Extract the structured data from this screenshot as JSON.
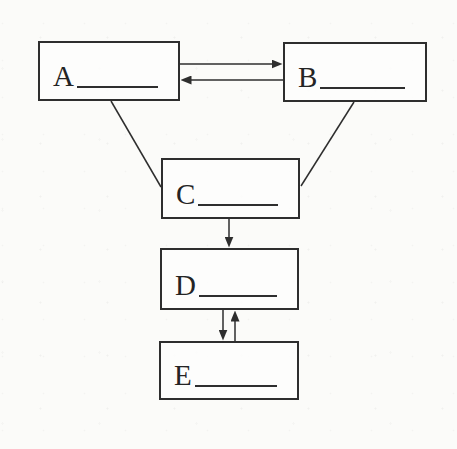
{
  "page": {
    "background_color": "#fbfbf9",
    "ink_color": "#2e2e2e"
  },
  "diagram": {
    "type": "flowchart",
    "nodes": [
      {
        "id": "A",
        "label": "A",
        "blank": true
      },
      {
        "id": "B",
        "label": "B",
        "blank": true
      },
      {
        "id": "C",
        "label": "C",
        "blank": true
      },
      {
        "id": "D",
        "label": "D",
        "blank": true
      },
      {
        "id": "E",
        "label": "E",
        "blank": true
      }
    ],
    "edges": [
      {
        "from": "A",
        "to": "B",
        "style": "arrow",
        "orientation": "horizontal"
      },
      {
        "from": "B",
        "to": "A",
        "style": "arrow",
        "orientation": "horizontal"
      },
      {
        "from": "A",
        "to": "C",
        "style": "plain-line",
        "orientation": "diagonal"
      },
      {
        "from": "B",
        "to": "C",
        "style": "plain-line",
        "orientation": "diagonal"
      },
      {
        "from": "C",
        "to": "D",
        "style": "arrow",
        "orientation": "vertical"
      },
      {
        "from": "D",
        "to": "E",
        "style": "arrow",
        "orientation": "vertical"
      },
      {
        "from": "E",
        "to": "D",
        "style": "arrow",
        "orientation": "vertical"
      }
    ]
  }
}
